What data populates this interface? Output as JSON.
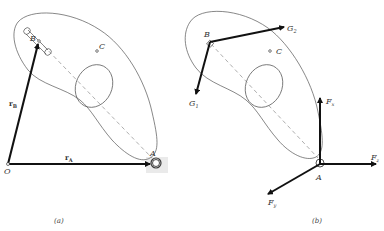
{
  "figure": {
    "panel_a": {
      "caption": "(a)",
      "points": {
        "O": "O",
        "A": "A",
        "B": "B",
        "C": "C"
      },
      "vectors": {
        "rA": {
          "main": "r",
          "sub": "A"
        },
        "rB": {
          "main": "r",
          "sub": "B"
        }
      }
    },
    "panel_b": {
      "caption": "(b)",
      "points": {
        "A": "A",
        "B": "B",
        "C": "C"
      },
      "forces": {
        "G1": {
          "main": "G",
          "sub": "1"
        },
        "G2": {
          "main": "G",
          "sub": "2"
        },
        "Fx": {
          "main": "F",
          "sub": "x"
        },
        "Fy": {
          "main": "F",
          "sub": "y"
        },
        "Fz": {
          "main": "F",
          "sub": "z"
        }
      }
    }
  }
}
